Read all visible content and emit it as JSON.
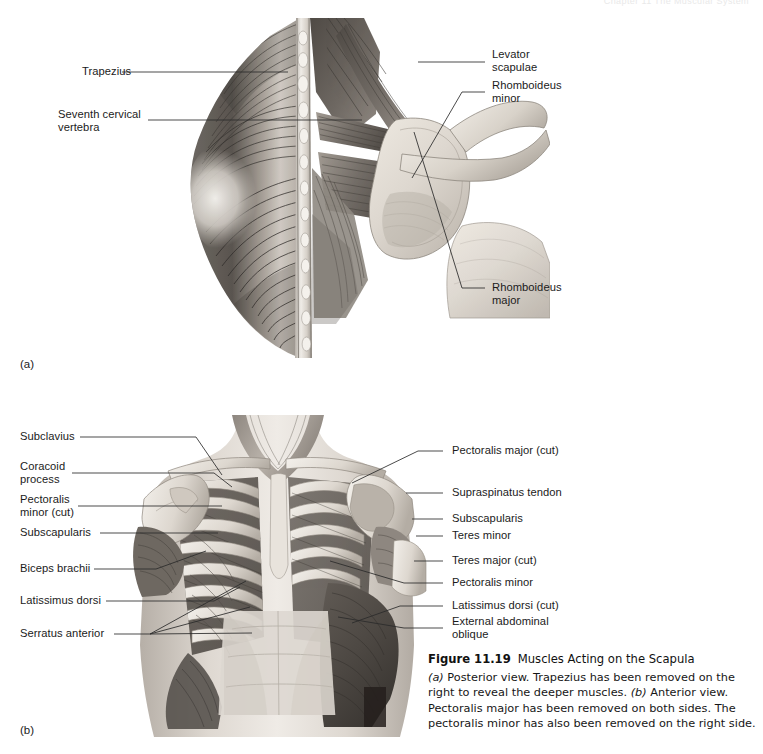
{
  "running_head": "Chapter 11  The Muscular System",
  "panel_a": {
    "tag": "(a)",
    "labels": [
      {
        "id": "trapezius",
        "text": "Trapezius"
      },
      {
        "id": "seventh-cervical",
        "text": "Seventh cervical\nvertebra"
      },
      {
        "id": "levator-scapulae",
        "text": "Levator\nscapulae"
      },
      {
        "id": "rhomboideus-minor",
        "text": "Rhomboideus\nminor"
      },
      {
        "id": "rhomboideus-major",
        "text": "Rhomboideus\nmajor"
      }
    ]
  },
  "panel_b": {
    "tag": "(b)",
    "labels_left": [
      {
        "id": "subclavius",
        "text": "Subclavius"
      },
      {
        "id": "coracoid-process",
        "text": "Coracoid\nprocess"
      },
      {
        "id": "pectoralis-minor-cut",
        "text": "Pectoralis\nminor (cut)"
      },
      {
        "id": "subscapularis",
        "text": "Subscapularis"
      },
      {
        "id": "biceps-brachii",
        "text": "Biceps brachii"
      },
      {
        "id": "latissimus-dorsi",
        "text": "Latissimus dorsi"
      },
      {
        "id": "serratus-anterior",
        "text": "Serratus anterior"
      }
    ],
    "labels_right": [
      {
        "id": "pectoralis-major-cut",
        "text": "Pectoralis major (cut)"
      },
      {
        "id": "supraspinatus-tendon",
        "text": "Supraspinatus tendon"
      },
      {
        "id": "subscapularis-r",
        "text": "Subscapularis"
      },
      {
        "id": "teres-minor",
        "text": "Teres minor"
      },
      {
        "id": "teres-major-cut",
        "text": "Teres major (cut)"
      },
      {
        "id": "pectoralis-minor",
        "text": "Pectoralis minor"
      },
      {
        "id": "latissimus-dorsi-cut",
        "text": "Latissimus dorsi (cut)"
      },
      {
        "id": "external-abdominal-oblique",
        "text": "External abdominal\noblique"
      }
    ]
  },
  "caption": {
    "figure_number": "Figure 11.19",
    "title": "Muscles Acting on the Scapula",
    "body_part_a_tag": "(a)",
    "body_1": " Posterior view. Trapezius has been removed on the right to reveal the deeper muscles. ",
    "body_part_b_tag": "(b)",
    "body_2": " Anterior view. Pectoralis major has been removed on both sides. The pectoralis minor has also been removed on the right side."
  },
  "colors": {
    "page_background": "#ffffff",
    "ink": "#1b1b1b",
    "leader": "#2a2a2a",
    "muscle_dark": "#4a4744",
    "muscle_mid": "#8d8781",
    "bone_light": "#ddd7cf"
  }
}
